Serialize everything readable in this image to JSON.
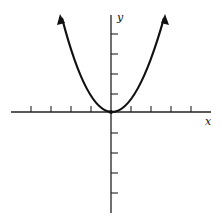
{
  "figure": {
    "type": "function-graph",
    "function": "parabola y = x^2",
    "x_axis_label": "x",
    "y_axis_label": "y",
    "x_ticks_each_side": 5,
    "y_ticks_each_side": 5,
    "curve_color": "#111111",
    "axis_color": "#222222"
  }
}
